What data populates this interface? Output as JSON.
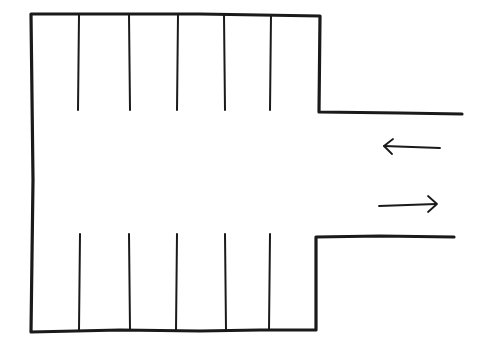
{
  "diagram": {
    "type": "parking-lot-sketch",
    "colors": {
      "ink": "#1a1a1a",
      "background": "#ffffff"
    },
    "outline": {
      "left_x": 31,
      "top_y": 15,
      "bottom_y": 332,
      "inner_right_x": 319,
      "entrance_top_y": 112,
      "entrance_bottom_y": 237,
      "entrance_top_end_x": 462,
      "entrance_bottom_end_x": 454
    },
    "top_stalls": {
      "x": [
        79,
        129,
        178,
        224,
        271
      ],
      "y1": 15,
      "y2": 110,
      "count": 5
    },
    "bottom_stalls": {
      "x": [
        80,
        129,
        177,
        225,
        270
      ],
      "y1": 234,
      "y2": 330,
      "count": 5
    },
    "arrows": [
      {
        "direction": "left",
        "y": 147,
        "x_start": 440,
        "x_end": 383
      },
      {
        "direction": "right",
        "y": 205,
        "x_start": 379,
        "x_end": 437
      }
    ]
  }
}
